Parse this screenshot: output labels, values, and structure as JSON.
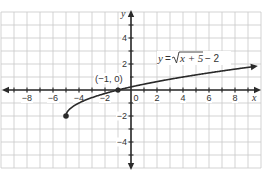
{
  "chart_data": {
    "type": "line",
    "title": "",
    "function_label": "y = √(x + 5) − 2",
    "function_label_parts": {
      "lhs": "y",
      "eq": "=",
      "radicand": "x + 5",
      "rest": "− 2"
    },
    "xlabel": "x",
    "ylabel": "y",
    "xlim": [
      -10,
      10
    ],
    "ylim": [
      -6,
      6
    ],
    "grid": true,
    "x_tick_labels": [
      "−8",
      "−6",
      "−4",
      "−2",
      "0",
      "2",
      "4",
      "6",
      "8"
    ],
    "x_tick_values": [
      -8,
      -6,
      -4,
      -2,
      0,
      2,
      4,
      6,
      8
    ],
    "y_tick_labels": [
      "4",
      "2",
      "−2",
      "−4"
    ],
    "y_tick_values": [
      4,
      2,
      -2,
      -4
    ],
    "series": [
      {
        "name": "y = √(x + 5) − 2",
        "x": [
          -5,
          -4.75,
          -4.5,
          -4,
          -3,
          -2,
          -1,
          0,
          1,
          2,
          4,
          6,
          8,
          9.6
        ],
        "y": [
          -2,
          -1.5,
          -1.29,
          -1,
          -0.59,
          -0.27,
          0,
          0.24,
          0.45,
          0.65,
          1,
          1.32,
          1.61,
          1.82
        ],
        "start_point": {
          "x": -5,
          "y": -2,
          "closed": true
        },
        "end": "arrow"
      }
    ],
    "annotations": [
      {
        "text": "(−1, 0)",
        "x": -1,
        "y": 0,
        "marked_point": true
      }
    ]
  },
  "labels": {
    "point": "(−1, 0)",
    "x_axis": "x",
    "y_axis": "y",
    "eq_lhs": "y",
    "eq_eq": "=",
    "eq_radicand": "x + 5",
    "eq_rest": "− 2"
  }
}
